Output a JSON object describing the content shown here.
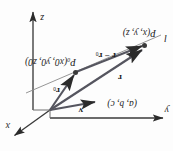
{
  "figure": {
    "kind": "vector-line-3d-diagram",
    "orientation_degrees": 180,
    "background_color": "#fdfdfd",
    "ink_color": "#3a3a3a",
    "label_color": "#1c1c1c"
  },
  "axes": [
    {
      "id": "x",
      "label": "x",
      "direction": "up-right",
      "tip": [
        160,
        14
      ],
      "origin": [
        123,
        41
      ]
    },
    {
      "id": "y",
      "label": "y",
      "direction": "left",
      "tip": [
        8,
        33
      ],
      "origin": [
        123,
        41
      ]
    },
    {
      "id": "z",
      "label": "z",
      "direction": "down",
      "tip": [
        140,
        142
      ],
      "origin": [
        140,
        41
      ]
    }
  ],
  "points": [
    {
      "id": "P0",
      "name": "P_0",
      "label_main": "P",
      "label_sub": "0",
      "coords": "(x",
      "coords_full": "(x0, y0, z0)",
      "x0": "x",
      "x0sub": "0",
      "y0": "y",
      "y0sub": "0",
      "z0": "z",
      "z0sub": "0",
      "at": [
        97,
        78
      ]
    },
    {
      "id": "P",
      "name": "P",
      "label_main": "P",
      "coords_full": "(x, y, z)",
      "at": [
        28,
        105
      ]
    }
  ],
  "vectors": [
    {
      "id": "r0",
      "label": "r",
      "sub": "0",
      "from": "origin",
      "to": "P0"
    },
    {
      "id": "r",
      "label": "r",
      "sub": "",
      "from": "origin",
      "to": "P"
    },
    {
      "id": "r-minus-r0",
      "label": "r − r",
      "sub": "0",
      "from": "P0",
      "to": "P"
    },
    {
      "id": "v",
      "label": "v",
      "sub": "",
      "note": "direction vector of the line"
    }
  ],
  "labels": {
    "axis_x": "x",
    "axis_y": "y",
    "axis_z": "z",
    "line_name": "l",
    "vector_v": "v",
    "components_v": "(a, b, c)",
    "vector_r": "r",
    "vector_r0_main": "r",
    "vector_r0_sub": "0",
    "difference_main": "r − r",
    "difference_sub": "0",
    "point_P_main": "P",
    "point_P_coords": "(x, y, z)",
    "point_P0_main": "P",
    "point_P0_sub": "0",
    "point_P0_coords_open": "(x",
    "point_P0_coords": "(x0, y0, z0)"
  }
}
